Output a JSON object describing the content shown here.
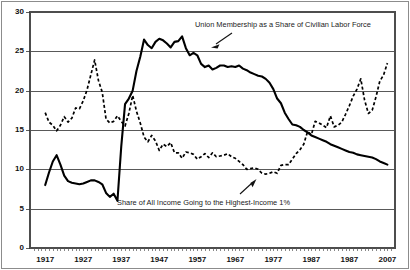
{
  "chart_data": {
    "type": "line",
    "title": "",
    "xlabel": "",
    "ylabel": "",
    "xlim": [
      1913,
      2009
    ],
    "ylim": [
      0,
      30
    ],
    "grid": true,
    "grid_axis": "y",
    "legend": "none",
    "legend_position": "inline-annotations",
    "y_ticks": [
      "0",
      "5",
      "10",
      "15",
      "20",
      "25",
      "30"
    ],
    "y_tick_values": [
      0,
      5,
      10,
      15,
      20,
      25,
      30
    ],
    "x_ticks": [
      "1917",
      "1927",
      "1937",
      "1947",
      "1957",
      "1967",
      "1977",
      "1987",
      "1987",
      "2007"
    ],
    "x_tick_values": [
      1917,
      1927,
      1937,
      1947,
      1957,
      1967,
      1977,
      1987,
      1997,
      2007
    ],
    "annotations": [
      {
        "id": "union-annotation",
        "text": "Union Membership as a Share of Civilian Labor Force",
        "points_to_series": "union_membership"
      },
      {
        "id": "income-annotation",
        "text": "Share of All Income Going to the Highest-Income 1%",
        "points_to_series": "top_income_share"
      }
    ],
    "series": [
      {
        "name": "Union Membership as a Share of Civilian Labor Force",
        "key": "union_membership",
        "style": "solid",
        "color": "#000000",
        "x": [
          1917,
          1918,
          1919,
          1920,
          1921,
          1922,
          1923,
          1924,
          1925,
          1926,
          1927,
          1928,
          1929,
          1930,
          1931,
          1932,
          1933,
          1934,
          1935,
          1936,
          1937,
          1938,
          1939,
          1940,
          1941,
          1942,
          1943,
          1944,
          1945,
          1946,
          1947,
          1948,
          1949,
          1950,
          1951,
          1952,
          1953,
          1954,
          1955,
          1956,
          1957,
          1958,
          1959,
          1960,
          1961,
          1962,
          1963,
          1964,
          1965,
          1966,
          1967,
          1968,
          1969,
          1970,
          1971,
          1972,
          1973,
          1974,
          1975,
          1976,
          1977,
          1978,
          1979,
          1980,
          1981,
          1982,
          1983,
          1984,
          1985,
          1986,
          1987,
          1988,
          1989,
          1990,
          1991,
          1992,
          1993,
          1994,
          1995,
          1996,
          1997,
          1998,
          1999,
          2000,
          2001,
          2002,
          2003,
          2004,
          2005,
          2006,
          2007
        ],
        "y": [
          8.0,
          9.6,
          11.0,
          11.8,
          10.6,
          9.2,
          8.5,
          8.3,
          8.2,
          8.1,
          8.2,
          8.4,
          8.6,
          8.6,
          8.4,
          8.1,
          7.0,
          6.5,
          6.9,
          6.0,
          12.9,
          18.3,
          19.0,
          20.0,
          22.5,
          24.3,
          26.5,
          25.8,
          25.4,
          26.2,
          26.6,
          26.4,
          26.0,
          25.5,
          26.2,
          26.3,
          26.9,
          25.4,
          24.5,
          24.8,
          24.5,
          23.4,
          23.0,
          23.2,
          22.7,
          22.9,
          23.2,
          23.2,
          23.0,
          23.1,
          23.0,
          23.2,
          22.8,
          22.6,
          22.3,
          22.1,
          21.9,
          21.8,
          21.5,
          21.0,
          20.2,
          19.0,
          18.4,
          17.2,
          16.4,
          15.7,
          15.6,
          15.4,
          15.0,
          14.7,
          14.3,
          14.1,
          13.9,
          13.7,
          13.5,
          13.2,
          13.0,
          12.8,
          12.6,
          12.4,
          12.2,
          12.1,
          11.9,
          11.8,
          11.7,
          11.6,
          11.5,
          11.3,
          11.0,
          10.8,
          10.6
        ],
        "y_at_2007": 10.6,
        "peak": {
          "year": 1954,
          "value": 26.9
        },
        "min": {
          "year": 1936,
          "value": 6.0
        }
      },
      {
        "name": "Share of All Income Going to the Highest-Income 1%",
        "key": "top_income_share",
        "style": "dashed",
        "color": "#000000",
        "x": [
          1917,
          1918,
          1919,
          1920,
          1921,
          1922,
          1923,
          1924,
          1925,
          1926,
          1927,
          1928,
          1929,
          1930,
          1931,
          1932,
          1933,
          1934,
          1935,
          1936,
          1937,
          1938,
          1939,
          1940,
          1941,
          1942,
          1943,
          1944,
          1945,
          1946,
          1947,
          1948,
          1949,
          1950,
          1951,
          1952,
          1953,
          1954,
          1955,
          1956,
          1957,
          1958,
          1959,
          1960,
          1961,
          1962,
          1963,
          1964,
          1965,
          1966,
          1967,
          1968,
          1969,
          1970,
          1971,
          1972,
          1973,
          1974,
          1975,
          1976,
          1977,
          1978,
          1979,
          1980,
          1981,
          1982,
          1983,
          1984,
          1985,
          1986,
          1987,
          1988,
          1989,
          1990,
          1991,
          1992,
          1993,
          1994,
          1995,
          1996,
          1997,
          1998,
          1999,
          2000,
          2001,
          2002,
          2003,
          2004,
          2005,
          2006,
          2007
        ],
        "y": [
          17.2,
          16.0,
          15.6,
          14.9,
          15.6,
          16.7,
          16.0,
          16.5,
          17.8,
          17.7,
          18.7,
          20.1,
          22.0,
          23.9,
          21.3,
          19.8,
          16.4,
          15.9,
          16.1,
          16.8,
          16.1,
          15.5,
          17.1,
          19.4,
          17.4,
          15.9,
          14.1,
          13.5,
          14.3,
          13.6,
          12.4,
          13.2,
          12.9,
          13.4,
          12.1,
          12.1,
          11.4,
          12.2,
          12.1,
          11.9,
          11.3,
          11.6,
          12.0,
          11.5,
          12.1,
          11.6,
          11.7,
          11.8,
          12.0,
          11.6,
          11.4,
          11.0,
          10.6,
          10.0,
          10.1,
          10.2,
          10.0,
          9.5,
          9.4,
          9.5,
          9.7,
          9.5,
          10.5,
          10.6,
          10.6,
          11.3,
          12.0,
          12.5,
          13.2,
          14.8,
          14.4,
          16.1,
          15.9,
          15.6,
          15.3,
          16.8,
          15.4,
          15.6,
          16.0,
          17.0,
          18.1,
          19.3,
          20.2,
          21.5,
          18.8,
          17.1,
          17.5,
          19.2,
          21.2,
          22.0,
          23.5
        ],
        "y_at_2007": 23.5,
        "peak_early": {
          "year": 1928,
          "value": 23.9
        },
        "min": {
          "year": 1975,
          "value": 9.4
        }
      }
    ]
  }
}
